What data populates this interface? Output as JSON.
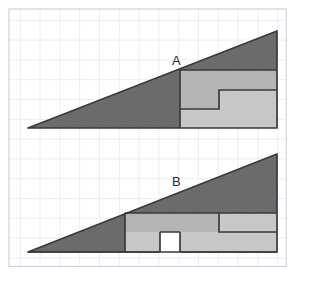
{
  "figure": {
    "type": "geometric-dissection-illusion",
    "labels": {
      "a": "A",
      "b": "B"
    },
    "colors": {
      "grid_line": "#d6dce6",
      "grid_border": "#c3cad6",
      "outline": "#3a3a3a",
      "dark_fill": "#6e6e6e",
      "light_fill": "#c9c9c9",
      "medium_fill": "#b4b4b4",
      "background": "#ffffff",
      "label_text": "#2b2b2b"
    },
    "grid": {
      "x0": 9,
      "y0": 9,
      "cell": 19.8,
      "cols": 14,
      "rows": 13
    },
    "shape_a": {
      "name": "arrangement-A",
      "triangle_dark": "28,128 277,31 277,70 180,70 180,128",
      "light_region": "180,70 277,70 277,128 180,128",
      "step_path_1": "180,70 277,70 277,90 219,90 219,109 180,109",
      "step_path_2": "180,109 219,109 219,90 277,90 277,128 180,128",
      "vertical_edge_x": 180,
      "apex_right_x": 277,
      "baseline_y": 128
    },
    "shape_b": {
      "name": "arrangement-B",
      "triangle_dark": "28,252 277,154 277,213 125,213 125,252",
      "light_region": "28,252 277,213 277,252 28,252",
      "notch": "160,232 180,232 180,252 160,252",
      "vertical_edge_x": 125,
      "step_x": 219,
      "apex_right_x": 277,
      "baseline_y": 252
    }
  }
}
